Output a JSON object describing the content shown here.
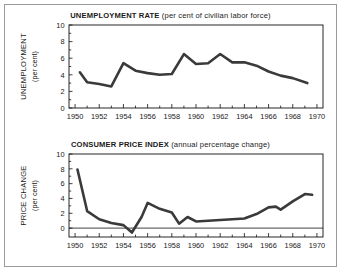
{
  "figure": {
    "background_color": "#ffffff",
    "border_color": "#9a9a9a",
    "line_color": "#3a3a3a",
    "axis_color": "#111111"
  },
  "panels": [
    {
      "name": "unemployment",
      "title_main": "UNEMPLOYMENT RATE",
      "title_sub": "(per cent of civilian labor force)",
      "ylabel_main": "UNEMPLOYMENT",
      "ylabel_sub": "(per cent)",
      "ytick_labels": [
        "0",
        "2",
        "4",
        "6",
        "8",
        "10"
      ],
      "xtick_labels": [
        "1950",
        "1952",
        "1954",
        "1956",
        "1958",
        "1960",
        "1962",
        "1964",
        "1966",
        "1968",
        "1970"
      ]
    },
    {
      "name": "cpi",
      "title_main": "CONSUMER PRICE INDEX",
      "title_sub": "(annual percentage change)",
      "ylabel_main": "PRICE CHANGE",
      "ylabel_sub": "(per cent)",
      "ytick_labels": [
        "0",
        "2",
        "4",
        "6",
        "8",
        "10"
      ],
      "xtick_labels": [
        "1950",
        "1952",
        "1954",
        "1956",
        "1958",
        "1960",
        "1962",
        "1964",
        "1966",
        "1968",
        "1970"
      ]
    }
  ],
  "chart_data": [
    {
      "type": "line",
      "title": "UNEMPLOYMENT RATE (per cent of civilian labor force)",
      "xlabel": "",
      "ylabel": "UNEMPLOYMENT (per cent)",
      "xlim": [
        1949.5,
        1970.5
      ],
      "ylim": [
        0,
        10
      ],
      "xticks": [
        1950,
        1952,
        1954,
        1956,
        1958,
        1960,
        1962,
        1964,
        1966,
        1968,
        1970
      ],
      "yticks": [
        0,
        2,
        4,
        6,
        8,
        10
      ],
      "minor_xticks_every": 1,
      "grid": false,
      "legend": false,
      "x": [
        1950.4,
        1951,
        1952,
        1953,
        1954,
        1955,
        1956,
        1957,
        1958,
        1959,
        1960,
        1961,
        1962,
        1963,
        1964,
        1965,
        1966,
        1967,
        1968,
        1969.2
      ],
      "values": [
        4.3,
        3.1,
        2.9,
        2.6,
        5.4,
        4.5,
        4.2,
        4.0,
        4.1,
        6.5,
        5.3,
        5.4,
        6.5,
        5.5,
        5.5,
        5.1,
        4.4,
        3.9,
        3.6,
        3.0
      ],
      "series_name": "Unemployment rate"
    },
    {
      "type": "line",
      "title": "CONSUMER PRICE INDEX (annual percentage change)",
      "xlabel": "",
      "ylabel": "PRICE CHANGE (per cent)",
      "xlim": [
        1949.5,
        1970.5
      ],
      "ylim": [
        -1.2,
        10
      ],
      "xticks": [
        1950,
        1952,
        1954,
        1956,
        1958,
        1960,
        1962,
        1964,
        1966,
        1968,
        1970
      ],
      "yticks": [
        0,
        2,
        4,
        6,
        8,
        10
      ],
      "minor_xticks_every": 1,
      "grid": false,
      "zero_line": true,
      "legend": false,
      "x": [
        1950.2,
        1951,
        1952,
        1953,
        1954,
        1954.7,
        1955.5,
        1956,
        1957,
        1958,
        1958.6,
        1959.3,
        1960,
        1961,
        1962,
        1963,
        1964,
        1965,
        1966,
        1966.6,
        1967,
        1968,
        1969,
        1969.6
      ],
      "values": [
        7.9,
        2.3,
        1.2,
        0.7,
        0.4,
        -0.6,
        1.5,
        3.4,
        2.6,
        2.1,
        0.6,
        1.5,
        0.9,
        1.0,
        1.1,
        1.2,
        1.3,
        1.9,
        2.8,
        2.9,
        2.5,
        3.6,
        4.6,
        4.5
      ],
      "series_name": "CPI annual percentage change"
    }
  ]
}
